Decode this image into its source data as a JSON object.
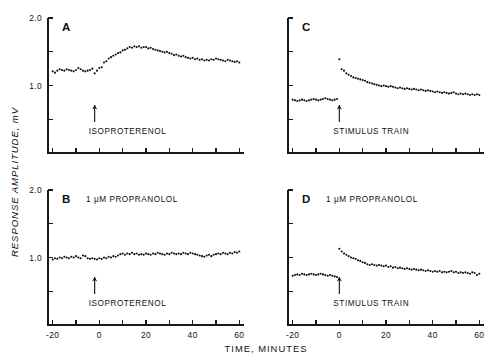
{
  "figure": {
    "background": "#ffffff",
    "ink_color": "#111111",
    "y_axis_title": "RESPONSE AMPLITUDE, mV",
    "x_axis_title": "TIME, MINUTES"
  },
  "axes": {
    "x_ticks": [
      -20,
      -10,
      0,
      10,
      20,
      30,
      40,
      50,
      60
    ],
    "x_tick_labels": [
      "-20",
      "",
      "0",
      "",
      "20",
      "",
      "40",
      "",
      "60"
    ],
    "xlim": [
      -22,
      62
    ],
    "y_ticks": [
      0,
      0.5,
      1.0,
      1.5,
      2.0
    ],
    "y_tick_labels_left": [
      "",
      "",
      "1.0",
      "",
      "2.0"
    ],
    "y_tick_labels_right": [
      "",
      "",
      "",
      "",
      ""
    ],
    "ylim": [
      0,
      2.0
    ]
  },
  "panels": [
    {
      "id": "A",
      "letter": "A",
      "position": "top-left",
      "condition": "",
      "arrow_label": "ISOPROTERENOL",
      "arrow_x": -2,
      "show_y_labels": true,
      "show_x_labels": false
    },
    {
      "id": "C",
      "letter": "C",
      "position": "top-right",
      "condition": "",
      "arrow_label": "STIMULUS TRAIN",
      "arrow_x": 0,
      "show_y_labels": false,
      "show_x_labels": false
    },
    {
      "id": "B",
      "letter": "B",
      "position": "bottom-left",
      "condition": "1 μM PROPRANOLOL",
      "arrow_label": "ISOPROTERENOL",
      "arrow_x": -2,
      "show_y_labels": true,
      "show_x_labels": true
    },
    {
      "id": "D",
      "letter": "D",
      "position": "bottom-right",
      "condition": "1 μM PROPRANOLOL",
      "arrow_label": "STIMULUS TRAIN",
      "arrow_x": 0,
      "show_y_labels": false,
      "show_x_labels": true
    }
  ],
  "chart_data": {
    "type": "scatter",
    "title": "",
    "xlabel": "TIME, MINUTES",
    "ylabel": "RESPONSE AMPLITUDE, mV",
    "xlim": [
      -22,
      62
    ],
    "ylim": [
      0,
      2.0
    ],
    "grid": false,
    "legend": "none",
    "panels": [
      {
        "name": "A",
        "annotation": "ISOPROTERENOL",
        "annotation_x": -2,
        "x": [
          -20,
          -19,
          -18,
          -17,
          -16,
          -15,
          -14,
          -13,
          -12,
          -11,
          -10,
          -9,
          -8,
          -7,
          -6,
          -5,
          -4,
          -3,
          -2,
          -1,
          0,
          1,
          2,
          3,
          4,
          5,
          6,
          7,
          8,
          9,
          10,
          11,
          12,
          13,
          14,
          15,
          16,
          17,
          18,
          19,
          20,
          21,
          22,
          23,
          24,
          25,
          26,
          27,
          28,
          29,
          30,
          31,
          32,
          33,
          34,
          35,
          36,
          37,
          38,
          39,
          40,
          41,
          42,
          43,
          44,
          45,
          46,
          47,
          48,
          49,
          50,
          51,
          52,
          53,
          54,
          55,
          56,
          57,
          58,
          59,
          60
        ],
        "y": [
          1.21,
          1.19,
          1.22,
          1.24,
          1.23,
          1.22,
          1.24,
          1.23,
          1.22,
          1.21,
          1.23,
          1.26,
          1.24,
          1.22,
          1.21,
          1.22,
          1.23,
          1.25,
          1.18,
          1.22,
          1.26,
          1.27,
          1.34,
          1.36,
          1.4,
          1.42,
          1.44,
          1.46,
          1.48,
          1.49,
          1.52,
          1.53,
          1.55,
          1.57,
          1.56,
          1.58,
          1.57,
          1.58,
          1.56,
          1.57,
          1.57,
          1.55,
          1.56,
          1.54,
          1.53,
          1.52,
          1.51,
          1.5,
          1.49,
          1.5,
          1.48,
          1.47,
          1.45,
          1.46,
          1.44,
          1.43,
          1.44,
          1.42,
          1.41,
          1.4,
          1.41,
          1.39,
          1.4,
          1.38,
          1.39,
          1.37,
          1.38,
          1.37,
          1.39,
          1.38,
          1.4,
          1.39,
          1.38,
          1.37,
          1.36,
          1.38,
          1.37,
          1.36,
          1.35,
          1.36,
          1.34
        ]
      },
      {
        "name": "C",
        "annotation": "STIMULUS TRAIN",
        "annotation_x": 0,
        "x": [
          -20,
          -19,
          -18,
          -17,
          -16,
          -15,
          -14,
          -13,
          -12,
          -11,
          -10,
          -9,
          -8,
          -7,
          -6,
          -5,
          -4,
          -3,
          -2,
          -1,
          0,
          1,
          2,
          3,
          4,
          5,
          6,
          7,
          8,
          9,
          10,
          11,
          12,
          13,
          14,
          15,
          16,
          17,
          18,
          19,
          20,
          21,
          22,
          23,
          24,
          25,
          26,
          27,
          28,
          29,
          30,
          31,
          32,
          33,
          34,
          35,
          36,
          37,
          38,
          39,
          40,
          41,
          42,
          43,
          44,
          45,
          46,
          47,
          48,
          49,
          50,
          51,
          52,
          53,
          54,
          55,
          56,
          57,
          58,
          59,
          60
        ],
        "y": [
          0.79,
          0.78,
          0.77,
          0.78,
          0.79,
          0.78,
          0.77,
          0.78,
          0.79,
          0.8,
          0.79,
          0.78,
          0.79,
          0.8,
          0.81,
          0.8,
          0.79,
          0.78,
          0.79,
          0.8,
          1.39,
          1.24,
          1.22,
          1.18,
          1.16,
          1.14,
          1.12,
          1.11,
          1.1,
          1.09,
          1.08,
          1.07,
          1.05,
          1.04,
          1.03,
          1.02,
          1.01,
          1.0,
          0.99,
          1.0,
          0.99,
          0.98,
          0.99,
          0.98,
          0.97,
          0.96,
          0.97,
          0.96,
          0.95,
          0.96,
          0.95,
          0.94,
          0.95,
          0.94,
          0.93,
          0.94,
          0.93,
          0.92,
          0.93,
          0.92,
          0.91,
          0.9,
          0.91,
          0.9,
          0.89,
          0.9,
          0.89,
          0.88,
          0.89,
          0.9,
          0.88,
          0.87,
          0.88,
          0.87,
          0.88,
          0.87,
          0.86,
          0.87,
          0.86,
          0.87,
          0.86
        ]
      },
      {
        "name": "B",
        "condition": "1 μM PROPRANOLOL",
        "annotation": "ISOPROTERENOL",
        "annotation_x": -2,
        "x": [
          -20,
          -19,
          -18,
          -17,
          -16,
          -15,
          -14,
          -13,
          -12,
          -11,
          -10,
          -9,
          -8,
          -7,
          -6,
          -5,
          -4,
          -3,
          -2,
          -1,
          0,
          1,
          2,
          3,
          4,
          5,
          6,
          7,
          8,
          9,
          10,
          11,
          12,
          13,
          14,
          15,
          16,
          17,
          18,
          19,
          20,
          21,
          22,
          23,
          24,
          25,
          26,
          27,
          28,
          29,
          30,
          31,
          32,
          33,
          34,
          35,
          36,
          37,
          38,
          39,
          40,
          41,
          42,
          43,
          44,
          45,
          46,
          47,
          48,
          49,
          50,
          51,
          52,
          53,
          54,
          55,
          56,
          57,
          58,
          59,
          60
        ],
        "y": [
          0.97,
          0.99,
          0.98,
          1.0,
          0.99,
          1.01,
          1.0,
          0.99,
          1.01,
          1.0,
          1.02,
          1.0,
          0.99,
          1.03,
          1.02,
          0.99,
          0.98,
          0.99,
          0.98,
          0.97,
          0.99,
          0.98,
          1.0,
          0.99,
          1.01,
          1.0,
          1.02,
          1.01,
          1.03,
          1.05,
          1.06,
          1.04,
          1.06,
          1.05,
          1.07,
          1.05,
          1.06,
          1.04,
          1.05,
          1.04,
          1.06,
          1.05,
          1.04,
          1.06,
          1.05,
          1.07,
          1.06,
          1.05,
          1.04,
          1.06,
          1.05,
          1.07,
          1.06,
          1.05,
          1.06,
          1.05,
          1.07,
          1.06,
          1.05,
          1.07,
          1.06,
          1.05,
          1.04,
          1.03,
          1.02,
          1.01,
          1.03,
          1.04,
          1.02,
          1.04,
          1.05,
          1.06,
          1.05,
          1.07,
          1.06,
          1.05,
          1.07,
          1.06,
          1.08,
          1.07,
          1.09
        ]
      },
      {
        "name": "D",
        "condition": "1 μM PROPRANOLOL",
        "annotation": "STIMULUS TRAIN",
        "annotation_x": 0,
        "x": [
          -20,
          -19,
          -18,
          -17,
          -16,
          -15,
          -14,
          -13,
          -12,
          -11,
          -10,
          -9,
          -8,
          -7,
          -6,
          -5,
          -4,
          -3,
          -2,
          -1,
          0,
          1,
          2,
          3,
          4,
          5,
          6,
          7,
          8,
          9,
          10,
          11,
          12,
          13,
          14,
          15,
          16,
          17,
          18,
          19,
          20,
          21,
          22,
          23,
          24,
          25,
          26,
          27,
          28,
          29,
          30,
          31,
          32,
          33,
          34,
          35,
          36,
          37,
          38,
          39,
          40,
          41,
          42,
          43,
          44,
          45,
          46,
          47,
          48,
          49,
          50,
          51,
          52,
          53,
          54,
          55,
          56,
          57,
          58,
          59,
          60
        ],
        "y": [
          0.73,
          0.74,
          0.75,
          0.74,
          0.76,
          0.75,
          0.74,
          0.75,
          0.76,
          0.75,
          0.74,
          0.75,
          0.76,
          0.75,
          0.74,
          0.73,
          0.74,
          0.73,
          0.72,
          0.71,
          1.13,
          1.09,
          1.06,
          1.04,
          1.02,
          1.0,
          0.99,
          0.98,
          0.96,
          0.95,
          0.93,
          0.92,
          0.9,
          0.89,
          0.9,
          0.89,
          0.88,
          0.89,
          0.88,
          0.87,
          0.88,
          0.86,
          0.87,
          0.85,
          0.86,
          0.84,
          0.85,
          0.84,
          0.83,
          0.84,
          0.83,
          0.82,
          0.83,
          0.82,
          0.81,
          0.82,
          0.81,
          0.8,
          0.81,
          0.8,
          0.79,
          0.8,
          0.79,
          0.8,
          0.78,
          0.79,
          0.78,
          0.79,
          0.8,
          0.78,
          0.79,
          0.77,
          0.78,
          0.77,
          0.78,
          0.77,
          0.76,
          0.78,
          0.77,
          0.74,
          0.76
        ]
      }
    ]
  }
}
